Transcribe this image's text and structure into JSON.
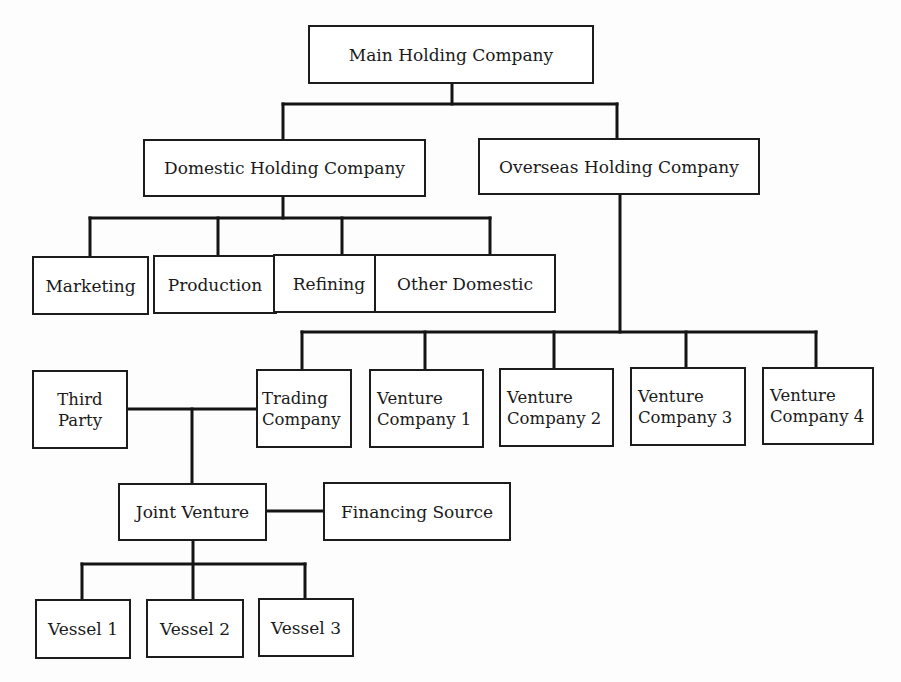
{
  "diagram": {
    "type": "organization-chart",
    "nodes": {
      "main": "Main Holding Company",
      "domestic": "Domestic Holding Company",
      "overseas": "Overseas Holding Company",
      "marketing": "Marketing",
      "production": "Production",
      "refining": "Refining",
      "other_domestic": "Other Domestic",
      "third_party": "Third\nParty",
      "trading": "Trading\nCompany",
      "venture1": "Venture\nCompany 1",
      "venture2": "Venture\nCompany 2",
      "venture3": "Venture\nCompany 3",
      "venture4": "Venture\nCompany 4",
      "joint_venture": "Joint Venture",
      "financing": "Financing Source",
      "vessel1": "Vessel 1",
      "vessel2": "Vessel 2",
      "vessel3": "Vessel 3"
    },
    "edges": [
      [
        "Main Holding Company",
        "Domestic Holding Company"
      ],
      [
        "Main Holding Company",
        "Overseas Holding Company"
      ],
      [
        "Domestic Holding Company",
        "Marketing"
      ],
      [
        "Domestic Holding Company",
        "Production"
      ],
      [
        "Domestic Holding Company",
        "Refining"
      ],
      [
        "Domestic Holding Company",
        "Other Domestic"
      ],
      [
        "Overseas Holding Company",
        "Trading Company"
      ],
      [
        "Overseas Holding Company",
        "Venture Company 1"
      ],
      [
        "Overseas Holding Company",
        "Venture Company 2"
      ],
      [
        "Overseas Holding Company",
        "Venture Company 3"
      ],
      [
        "Overseas Holding Company",
        "Venture Company 4"
      ],
      [
        "Third Party",
        "Joint Venture"
      ],
      [
        "Trading Company",
        "Joint Venture"
      ],
      [
        "Joint Venture",
        "Financing Source"
      ],
      [
        "Joint Venture",
        "Vessel 1"
      ],
      [
        "Joint Venture",
        "Vessel 2"
      ],
      [
        "Joint Venture",
        "Vessel 3"
      ]
    ]
  }
}
